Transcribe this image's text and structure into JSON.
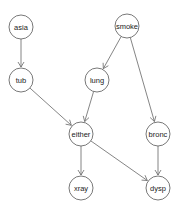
{
  "diagram": {
    "type": "directed-acyclic-graph",
    "node_radius": 12,
    "colors": {
      "stroke": "#555555",
      "edge": "#666666",
      "fill": "#ffffff",
      "text": "#222222"
    },
    "nodes": [
      {
        "id": "asia",
        "label": "asia",
        "x": 21,
        "y": 27
      },
      {
        "id": "smoke",
        "label": "smoke",
        "x": 127,
        "y": 26
      },
      {
        "id": "tub",
        "label": "tub",
        "x": 21,
        "y": 80
      },
      {
        "id": "lung",
        "label": "lung",
        "x": 97,
        "y": 80
      },
      {
        "id": "either",
        "label": "either",
        "x": 81,
        "y": 134
      },
      {
        "id": "bronc",
        "label": "bronc",
        "x": 158,
        "y": 134
      },
      {
        "id": "xray",
        "label": "xray",
        "x": 81,
        "y": 188
      },
      {
        "id": "dysp",
        "label": "dysp",
        "x": 158,
        "y": 188
      }
    ],
    "edges": [
      {
        "from": "asia",
        "to": "tub"
      },
      {
        "from": "smoke",
        "to": "lung"
      },
      {
        "from": "smoke",
        "to": "bronc"
      },
      {
        "from": "tub",
        "to": "either"
      },
      {
        "from": "lung",
        "to": "either"
      },
      {
        "from": "either",
        "to": "xray"
      },
      {
        "from": "either",
        "to": "dysp"
      },
      {
        "from": "bronc",
        "to": "dysp"
      }
    ]
  }
}
